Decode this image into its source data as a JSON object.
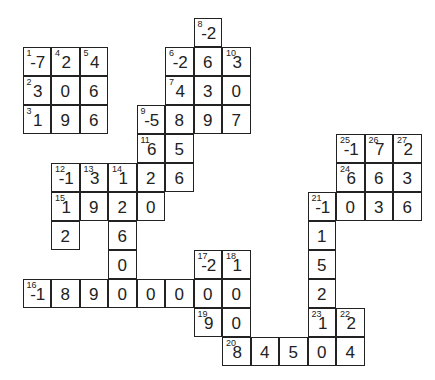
{
  "puzzle": {
    "type": "number-crossword",
    "grid": {
      "origin_x": 23,
      "origin_y": 18,
      "cell_w": 28.5,
      "cell_h": 29,
      "cols": 14,
      "rows": 12
    },
    "cells": [
      {
        "r": 0,
        "c": 6,
        "n": "8",
        "v": "-2"
      },
      {
        "r": 1,
        "c": 0,
        "n": "1",
        "v": "-7"
      },
      {
        "r": 1,
        "c": 1,
        "n": "4",
        "v": "2"
      },
      {
        "r": 1,
        "c": 2,
        "n": "5",
        "v": "4"
      },
      {
        "r": 1,
        "c": 5,
        "n": "6",
        "v": "-2"
      },
      {
        "r": 1,
        "c": 6,
        "n": "",
        "v": "6"
      },
      {
        "r": 1,
        "c": 7,
        "n": "10",
        "v": "3"
      },
      {
        "r": 2,
        "c": 0,
        "n": "2",
        "v": "3"
      },
      {
        "r": 2,
        "c": 1,
        "n": "",
        "v": "0"
      },
      {
        "r": 2,
        "c": 2,
        "n": "",
        "v": "6"
      },
      {
        "r": 2,
        "c": 5,
        "n": "7",
        "v": "4"
      },
      {
        "r": 2,
        "c": 6,
        "n": "",
        "v": "3"
      },
      {
        "r": 2,
        "c": 7,
        "n": "",
        "v": "0"
      },
      {
        "r": 3,
        "c": 0,
        "n": "3",
        "v": "1"
      },
      {
        "r": 3,
        "c": 1,
        "n": "",
        "v": "9"
      },
      {
        "r": 3,
        "c": 2,
        "n": "",
        "v": "6"
      },
      {
        "r": 3,
        "c": 4,
        "n": "9",
        "v": "-5"
      },
      {
        "r": 3,
        "c": 5,
        "n": "",
        "v": "8"
      },
      {
        "r": 3,
        "c": 6,
        "n": "",
        "v": "9"
      },
      {
        "r": 3,
        "c": 7,
        "n": "",
        "v": "7"
      },
      {
        "r": 4,
        "c": 4,
        "n": "11",
        "v": "6"
      },
      {
        "r": 4,
        "c": 5,
        "n": "",
        "v": "5"
      },
      {
        "r": 4,
        "c": 11,
        "n": "25",
        "v": "-1"
      },
      {
        "r": 4,
        "c": 12,
        "n": "26",
        "v": "7"
      },
      {
        "r": 4,
        "c": 13,
        "n": "27",
        "v": "2"
      },
      {
        "r": 5,
        "c": 1,
        "n": "12",
        "v": "-1"
      },
      {
        "r": 5,
        "c": 2,
        "n": "13",
        "v": "3"
      },
      {
        "r": 5,
        "c": 3,
        "n": "14",
        "v": "1"
      },
      {
        "r": 5,
        "c": 4,
        "n": "",
        "v": "2"
      },
      {
        "r": 5,
        "c": 5,
        "n": "",
        "v": "6"
      },
      {
        "r": 5,
        "c": 11,
        "n": "24",
        "v": "6"
      },
      {
        "r": 5,
        "c": 12,
        "n": "",
        "v": "6"
      },
      {
        "r": 5,
        "c": 13,
        "n": "",
        "v": "3"
      },
      {
        "r": 6,
        "c": 1,
        "n": "15",
        "v": "1"
      },
      {
        "r": 6,
        "c": 2,
        "n": "",
        "v": "9"
      },
      {
        "r": 6,
        "c": 3,
        "n": "",
        "v": "2"
      },
      {
        "r": 6,
        "c": 4,
        "n": "",
        "v": "0"
      },
      {
        "r": 6,
        "c": 10,
        "n": "21",
        "v": "-1"
      },
      {
        "r": 6,
        "c": 11,
        "n": "",
        "v": "0"
      },
      {
        "r": 6,
        "c": 12,
        "n": "",
        "v": "3"
      },
      {
        "r": 6,
        "c": 13,
        "n": "",
        "v": "6"
      },
      {
        "r": 7,
        "c": 1,
        "n": "",
        "v": "2"
      },
      {
        "r": 7,
        "c": 3,
        "n": "",
        "v": "6"
      },
      {
        "r": 7,
        "c": 10,
        "n": "",
        "v": "1"
      },
      {
        "r": 8,
        "c": 3,
        "n": "",
        "v": "0"
      },
      {
        "r": 8,
        "c": 6,
        "n": "17",
        "v": "-2"
      },
      {
        "r": 8,
        "c": 7,
        "n": "18",
        "v": "1"
      },
      {
        "r": 8,
        "c": 10,
        "n": "",
        "v": "5"
      },
      {
        "r": 9,
        "c": 0,
        "n": "16",
        "v": "-1"
      },
      {
        "r": 9,
        "c": 1,
        "n": "",
        "v": "8"
      },
      {
        "r": 9,
        "c": 2,
        "n": "",
        "v": "9"
      },
      {
        "r": 9,
        "c": 3,
        "n": "",
        "v": "0"
      },
      {
        "r": 9,
        "c": 4,
        "n": "",
        "v": "0"
      },
      {
        "r": 9,
        "c": 5,
        "n": "",
        "v": "0"
      },
      {
        "r": 9,
        "c": 6,
        "n": "",
        "v": "0"
      },
      {
        "r": 9,
        "c": 7,
        "n": "",
        "v": "0"
      },
      {
        "r": 9,
        "c": 10,
        "n": "",
        "v": "2"
      },
      {
        "r": 10,
        "c": 6,
        "n": "19",
        "v": "9"
      },
      {
        "r": 10,
        "c": 7,
        "n": "",
        "v": "0"
      },
      {
        "r": 10,
        "c": 10,
        "n": "23",
        "v": "1"
      },
      {
        "r": 10,
        "c": 11,
        "n": "22",
        "v": "2"
      },
      {
        "r": 11,
        "c": 7,
        "n": "20",
        "v": "8"
      },
      {
        "r": 11,
        "c": 8,
        "n": "",
        "v": "4"
      },
      {
        "r": 11,
        "c": 9,
        "n": "",
        "v": "5"
      },
      {
        "r": 11,
        "c": 10,
        "n": "",
        "v": "0"
      },
      {
        "r": 11,
        "c": 11,
        "n": "",
        "v": "4"
      }
    ]
  }
}
